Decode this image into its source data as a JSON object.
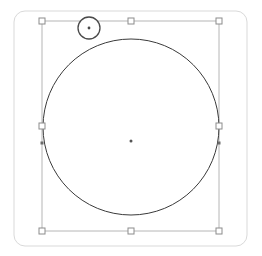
{
  "app": {
    "title": "Vector Canvas",
    "document_name": "Untitled",
    "tool": "select-tool"
  },
  "canvas": {
    "width": 262,
    "height": 256,
    "background_color": "#ffffff",
    "artboard": {
      "name": "artboard-frame",
      "x": 14,
      "y": 11,
      "width": 233,
      "height": 235,
      "corner_radius": 11,
      "stroke_color": "#d9d9d9",
      "stroke_width": 1,
      "fill": "none"
    }
  },
  "shape": {
    "name": "circle",
    "type": "ellipse",
    "center_x": 131,
    "center_y": 127,
    "radius": 88,
    "stroke_color": "#3a3a3a",
    "stroke_width": 1,
    "fill": "none",
    "selected": true
  },
  "selection": {
    "label": "selection-bounding-box",
    "x": 42,
    "y": 21,
    "width": 177,
    "height": 210,
    "stroke_color": "#b6b6b6",
    "stroke_width": 1,
    "handle_size": 6,
    "handle_fill": "#ffffff",
    "handle_stroke": "#8c8c8c",
    "handles": [
      {
        "name": "handle-top-left",
        "position": "top-left",
        "cx": 42,
        "cy": 21
      },
      {
        "name": "handle-top-center",
        "position": "top-center",
        "cx": 131,
        "cy": 21
      },
      {
        "name": "handle-top-right",
        "position": "top-right",
        "cx": 219,
        "cy": 21
      },
      {
        "name": "handle-middle-left",
        "position": "middle-left",
        "cx": 42,
        "cy": 126
      },
      {
        "name": "handle-middle-right",
        "position": "middle-right",
        "cx": 219,
        "cy": 126
      },
      {
        "name": "handle-bottom-left",
        "position": "bottom-left",
        "cx": 42,
        "cy": 231
      },
      {
        "name": "handle-bottom-center",
        "position": "bottom-center",
        "cx": 131,
        "cy": 231
      },
      {
        "name": "handle-bottom-right",
        "position": "bottom-right",
        "cx": 219,
        "cy": 231
      }
    ]
  },
  "rotation_handle": {
    "name": "rotation-handle",
    "cx": 89,
    "cy": 28,
    "radius": 11,
    "stroke_color": "#4a4a4a",
    "stroke_width": 1.3,
    "fill": "#ffffff",
    "dot_radius": 1.4,
    "dot_color": "#4a4a4a"
  },
  "center_marker": {
    "name": "center-point-marker",
    "cx": 131,
    "cy": 141,
    "radius": 1.5,
    "color": "#555555"
  },
  "snap_markers": {
    "name": "edge-snap-markers",
    "color": "#6b6b6b",
    "points": [
      {
        "name": "snap-left",
        "cx": 42,
        "cy": 143
      },
      {
        "name": "snap-right",
        "cx": 219,
        "cy": 143
      }
    ],
    "size": 3
  },
  "accessibility": {
    "canvas_description": "Selected circle with eight resize handles and a rotation handle"
  }
}
